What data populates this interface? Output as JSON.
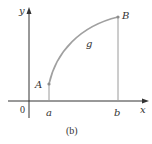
{
  "figure": {
    "caption": "(b)",
    "axes": {
      "x_label": "x",
      "y_label": "y",
      "origin_label": "0"
    },
    "ticks": {
      "a": "a",
      "b": "b"
    },
    "points": {
      "A": "A",
      "B": "B"
    },
    "curve_label": "g",
    "colors": {
      "axis": "#333333",
      "curve": "#a0a0a0",
      "point": "#8c8c8c"
    }
  }
}
